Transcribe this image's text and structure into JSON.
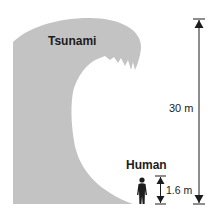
{
  "diagram": {
    "wave_label": "Tsunami",
    "human_label": "Human",
    "wave_height": "30 m",
    "human_height": "1.6 m",
    "colors": {
      "wave": "#c3c3c3",
      "ink": "#1c1c1c",
      "background": "#ffffff"
    }
  }
}
